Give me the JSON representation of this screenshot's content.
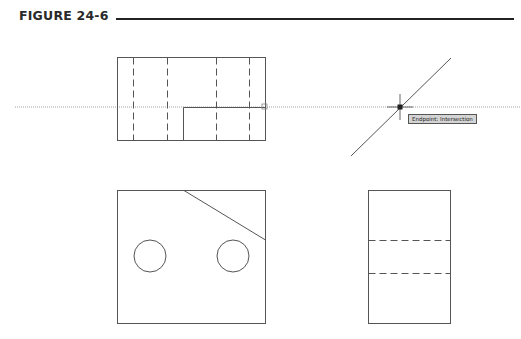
{
  "figure": {
    "title": "FIGURE 24-6"
  },
  "drawing": {
    "line_color": "#555555",
    "tracking_line_color": "#9a9a9a",
    "views": [
      {
        "name": "top-view",
        "rect": [
          117,
          57,
          265,
          140
        ],
        "hidden_lines_x": [
          133,
          167,
          216,
          249
        ],
        "inner_rect": [
          183,
          107,
          265,
          140
        ]
      },
      {
        "name": "front-view",
        "rect": [
          117,
          190,
          265,
          323
        ],
        "chamfer": [
          [
            184,
            190
          ],
          [
            265,
            240
          ]
        ],
        "holes": [
          {
            "cx": 150,
            "cy": 256,
            "r": 16
          },
          {
            "cx": 233,
            "cy": 256,
            "r": 16
          }
        ]
      },
      {
        "name": "side-view",
        "rect": [
          368,
          190,
          450,
          323
        ],
        "hidden_lines_y": [
          240,
          273
        ]
      },
      {
        "name": "miter-line",
        "from": [
          351,
          156
        ],
        "to": [
          451,
          58
        ]
      }
    ],
    "tracking_line_y": 107,
    "cursor": {
      "x": 400,
      "y": 107
    },
    "snap_marker": {
      "x": 264,
      "y": 107
    }
  },
  "tooltip": {
    "text": "Endpoint: Intersection"
  }
}
